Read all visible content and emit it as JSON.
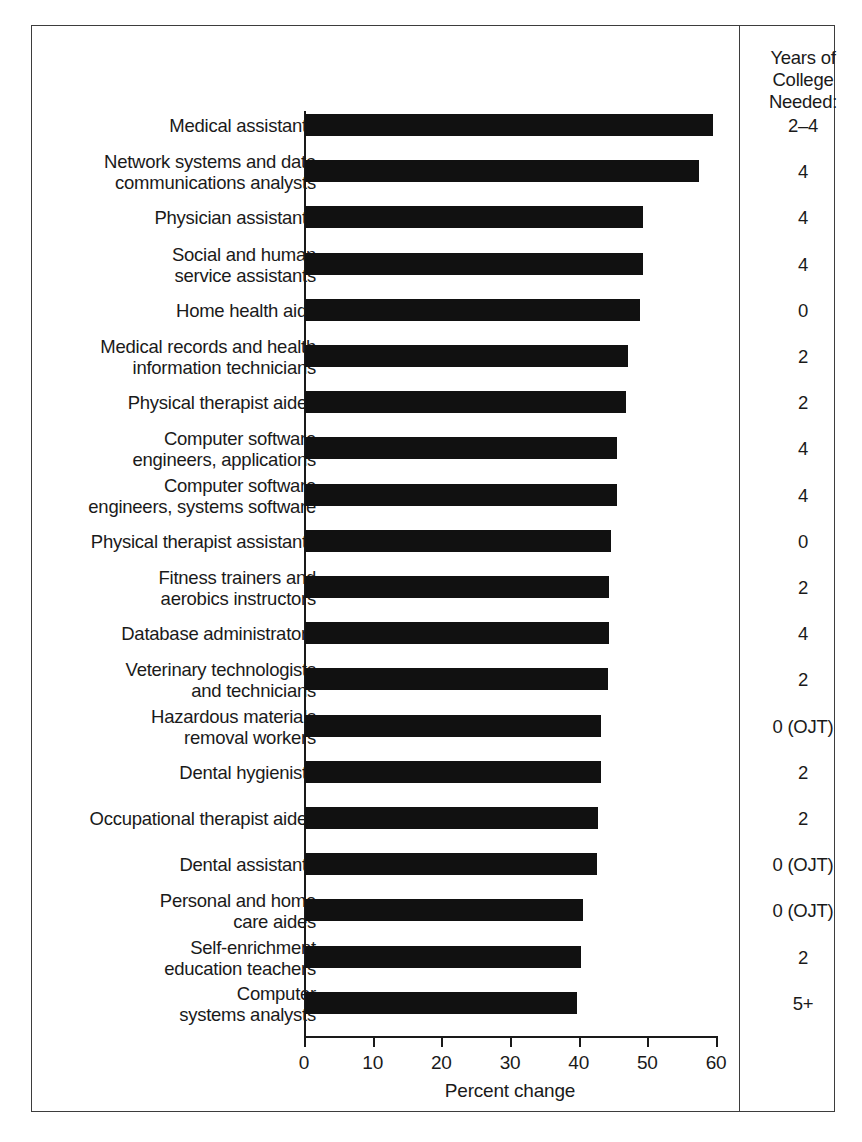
{
  "figure": {
    "x_axis_title": "Percent change",
    "years_column_header": "Years of\nCollege\nNeeded:",
    "tick_labels": [
      "0",
      "10",
      "20",
      "30",
      "40",
      "50",
      "60"
    ],
    "bar_color": "#111111",
    "frame_color": "#3d3d3d",
    "axis_color": "#1a1a1a"
  },
  "chart_data": {
    "type": "bar",
    "orientation": "horizontal",
    "title": "",
    "subtitle": "",
    "xlabel": "Percent change",
    "ylabel": "",
    "xlim": [
      0,
      60
    ],
    "xticks": [
      0,
      10,
      20,
      30,
      40,
      50,
      60
    ],
    "grid": false,
    "legend": null,
    "categories": [
      "Medical assistants",
      "Network systems and data\ncommunications analysts",
      "Physician assistants",
      "Social and human\nservice assistants",
      "Home health aids",
      "Medical records and health\ninformation technicians",
      "Physical therapist aides",
      "Computer software\nengineers, applications",
      "Computer software\nengineers, systems software",
      "Physical therapist assistants",
      "Fitness trainers and\naerobics instructors",
      "Database administrators",
      "Veterinary technologists\nand technicians",
      "Hazardous materials\nremoval workers",
      "Dental hygienists",
      "Occupational therapist aides",
      "Dental assistants",
      "Personal and home\ncare aides",
      "Self-enrichment\neducation teachers",
      "Computer\nsystems analysts"
    ],
    "values": [
      59.4,
      57.4,
      49.2,
      49.2,
      48.8,
      47.1,
      46.7,
      45.5,
      45.4,
      44.5,
      44.3,
      44.2,
      44.1,
      43.1,
      43.1,
      42.6,
      42.5,
      40.5,
      40.2,
      39.6
    ],
    "series": [
      {
        "name": "Percent change",
        "values": [
          59.4,
          57.4,
          49.2,
          49.2,
          48.8,
          47.1,
          46.7,
          45.5,
          45.4,
          44.5,
          44.3,
          44.2,
          44.1,
          43.1,
          43.1,
          42.6,
          42.5,
          40.5,
          40.2,
          39.6
        ]
      }
    ],
    "annotations_column": {
      "header": "Years of College Needed:",
      "values": [
        "2–4",
        "4",
        "4",
        "4",
        "0",
        "2",
        "2",
        "4",
        "4",
        "0",
        "2",
        "4",
        "2",
        "0 (OJT)",
        "2",
        "2",
        "0 (OJT)",
        "0 (OJT)",
        "2",
        "5+"
      ]
    }
  }
}
